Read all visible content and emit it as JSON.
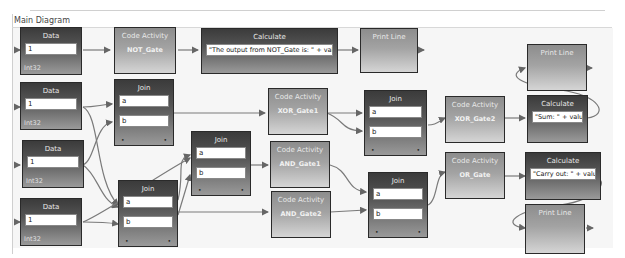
{
  "diagram": {
    "title": "Main Diagram"
  },
  "data_nodes": [
    {
      "header": "Data",
      "value": "1",
      "type": "Int32"
    },
    {
      "header": "Data",
      "value": "1",
      "type": "Int32"
    },
    {
      "header": "Data",
      "value": "1",
      "type": "Int32"
    },
    {
      "header": "Data",
      "value": "1",
      "type": "Int32"
    }
  ],
  "code_nodes": [
    {
      "header": "Code Activity",
      "name": "NOT_Gate"
    },
    {
      "header": "Code Activity",
      "name": "XOR_Gate1"
    },
    {
      "header": "Code Activity",
      "name": "AND_Gate1"
    },
    {
      "header": "Code Activity",
      "name": "AND_Gate2"
    },
    {
      "header": "Code Activity",
      "name": "XOR_Gate2"
    },
    {
      "header": "Code Activity",
      "name": "OR_Gate"
    }
  ],
  "join_nodes": [
    {
      "header": "Join",
      "input_a": "a",
      "input_b": "b"
    },
    {
      "header": "Join",
      "input_a": "a",
      "input_b": "b"
    },
    {
      "header": "Join",
      "input_a": "a",
      "input_b": "b"
    },
    {
      "header": "Join",
      "input_a": "a",
      "input_b": "b"
    },
    {
      "header": "Join",
      "input_a": "a",
      "input_b": "b"
    }
  ],
  "calculate_nodes": [
    {
      "header": "Calculate",
      "expression": "\"The output from NOT_Gate is: \" + value"
    },
    {
      "header": "Calculate",
      "expression": "\"Sum: \" + value"
    },
    {
      "header": "Calculate",
      "expression": "\"Carry out: \" + value"
    }
  ],
  "print_nodes": [
    {
      "header": "Print Line"
    },
    {
      "header": "Print Line"
    },
    {
      "header": "Print Line"
    }
  ],
  "colors": {
    "node_border": "#2a2a2a",
    "dark_node_top": "#3b3b3b",
    "light_node_top": "#8d8d8d",
    "wire": "#777777",
    "canvas": "#f6f6f6"
  }
}
